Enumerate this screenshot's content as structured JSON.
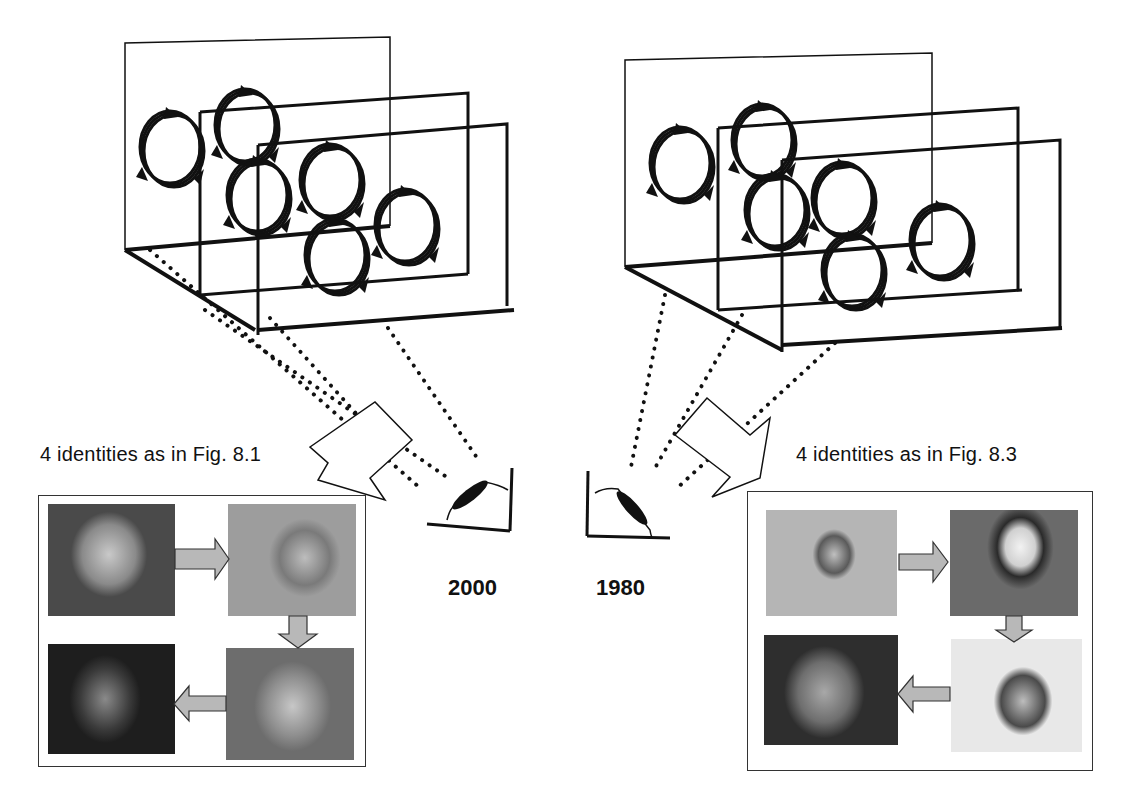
{
  "figure": {
    "left_panel": {
      "caption": "4 identities as in Fig. 8.1",
      "year": "2000",
      "photos": [
        {
          "name": "child-girl",
          "alt": "young girl smiling",
          "tone": "#8a8a8a"
        },
        {
          "name": "young-woman",
          "alt": "young woman",
          "tone": "#7a7a7a"
        },
        {
          "name": "older-woman",
          "alt": "older woman with short hair",
          "tone": "#8f8f8f"
        },
        {
          "name": "elderly-woman",
          "alt": "elderly woman with glasses",
          "tone": "#3a3a3a"
        }
      ],
      "arrow_sequence": [
        "right",
        "down",
        "left"
      ]
    },
    "right_panel": {
      "caption": "4 identities as in Fig. 8.3",
      "year": "1980",
      "photos": [
        {
          "name": "child-girl-curly",
          "alt": "young girl with curly hair",
          "tone": "#a5a5a5"
        },
        {
          "name": "young-woman-hat",
          "alt": "young woman with white hat",
          "tone": "#6a6a6a"
        },
        {
          "name": "middle-aged-woman",
          "alt": "middle-aged woman",
          "tone": "#b0b0b0"
        },
        {
          "name": "elderly-woman-2",
          "alt": "elderly woman",
          "tone": "#7e7e7e"
        }
      ],
      "arrow_sequence": [
        "right",
        "down",
        "left"
      ]
    },
    "colors": {
      "line": "#111111",
      "arrow_fill": "#b8b8b8",
      "box_border": "#333333"
    }
  }
}
